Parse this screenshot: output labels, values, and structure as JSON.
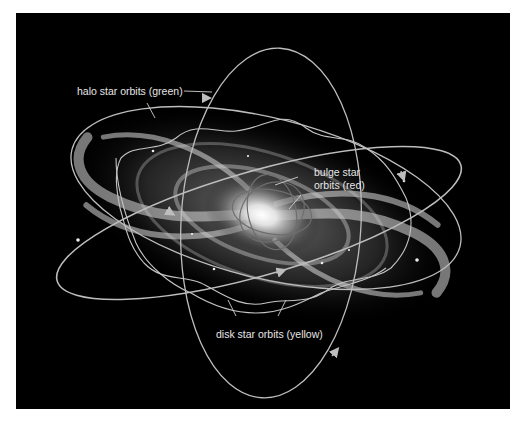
{
  "figure": {
    "background": "#000000",
    "frame_background": "#ffffff",
    "orbit_color": "#bdbdbd",
    "label_color": "#e6e6e6"
  },
  "labels": {
    "halo": "halo star orbits (green)",
    "bulge_line1": "bulge star",
    "bulge_line2": "orbits (red)",
    "disk": "disk star orbits (yellow)"
  },
  "components": [
    {
      "name": "galaxy-disk",
      "description": "spiral galaxy seen at an angle"
    },
    {
      "name": "halo-orbits",
      "count": 3
    },
    {
      "name": "disk-orbits",
      "count": 2
    },
    {
      "name": "bulge-orbits",
      "count": 3
    }
  ]
}
